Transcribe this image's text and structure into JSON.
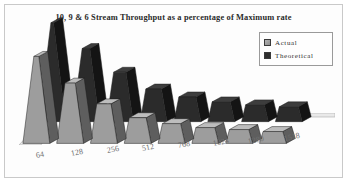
{
  "chart_data": {
    "type": "bar",
    "title": "10, 9 & 6 Stream Throughput as a percentage of Maximum rate",
    "xlabel": "",
    "ylabel": "",
    "ylim": [
      0,
      100
    ],
    "grid": false,
    "legend_position": "top-right",
    "categories": [
      "64",
      "128",
      "256",
      "512",
      "768",
      "1024",
      "1280",
      "1518"
    ],
    "series": [
      {
        "name": "Theoretical",
        "color": "#2e2e2e",
        "values": [
          100,
          74,
          50,
          33,
          25,
          20,
          17,
          15
        ]
      },
      {
        "name": "Actual",
        "color": "#9a9a9a",
        "values": [
          88,
          61,
          40,
          26,
          20,
          16,
          14,
          12
        ]
      }
    ]
  },
  "legend": {
    "items": [
      {
        "label": "Actual",
        "swatch": "actual-swatch"
      },
      {
        "label": "Theoretical",
        "swatch": "theoretical-swatch"
      }
    ]
  }
}
